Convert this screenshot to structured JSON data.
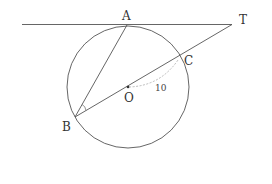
{
  "diagram": {
    "type": "geometry",
    "colors": {
      "stroke": "#555555",
      "dashed": "#aaaaaa",
      "text": "#333333",
      "background": "#ffffff"
    },
    "points": {
      "A": {
        "label": "A",
        "x": 127,
        "y": 25
      },
      "T": {
        "label": "T",
        "x": 232,
        "y": 24
      },
      "C": {
        "label": "C",
        "x": 180,
        "y": 58
      },
      "O": {
        "label": "O",
        "x": 128,
        "y": 87
      },
      "B": {
        "label": "B",
        "x": 75,
        "y": 117
      }
    },
    "circle": {
      "center": "O",
      "cx": 128,
      "cy": 87,
      "r": 61
    },
    "segments": [
      {
        "name": "tangent-line",
        "from": "left-end",
        "to": "T"
      },
      {
        "name": "secant-BT",
        "from": "B",
        "to": "T",
        "through": [
          "O",
          "C"
        ]
      },
      {
        "name": "chord-AB",
        "from": "A",
        "to": "B"
      }
    ],
    "annotations": {
      "radius_label": "10",
      "radius_marked": "OC (dashed arc)",
      "angle_mark": "angle ABC at B"
    }
  }
}
